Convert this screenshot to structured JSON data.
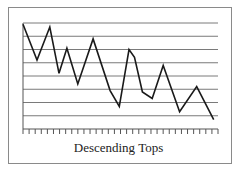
{
  "chart_data": {
    "type": "line",
    "title": "Descending Tops",
    "xlabel": "",
    "ylabel": "",
    "grid": true,
    "gridlines_y": 8,
    "ylim": [
      0,
      8
    ],
    "x_ticks": 33,
    "x": [
      0,
      2.3,
      4.4,
      5.9,
      7.2,
      9.0,
      11.5,
      14.3,
      15.8,
      17.4,
      18.3,
      19.6,
      21.2,
      23.0,
      25.7,
      28.5,
      31.3
    ],
    "series": [
      {
        "name": "Price",
        "values": [
          7.9,
          5.2,
          7.7,
          4.2,
          6.1,
          3.4,
          6.8,
          2.9,
          1.7,
          6.0,
          5.4,
          2.8,
          2.3,
          4.8,
          1.3,
          3.2,
          0.7
        ]
      }
    ],
    "colors": {
      "line": "#1a1a1a",
      "grid": "#7a7a7a",
      "frame": "#8a8a8a"
    }
  },
  "caption": "Descending Tops"
}
